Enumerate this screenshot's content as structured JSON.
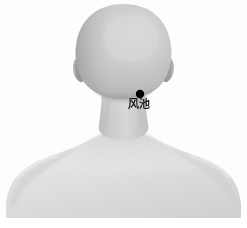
{
  "figure": {
    "background_color": "#ffffff",
    "width": 247,
    "height": 228
  },
  "body": {
    "skin_tone_head": "#c6c6c6",
    "skin_tone_head_shadow": "#ababab",
    "skin_tone_head_highlight": "#d8d8d8",
    "skin_tone_neck": "#cfcfcf",
    "skin_tone_torso": "#e2e2e2",
    "skin_tone_torso_shadow": "#cdcdcd",
    "outline_color": "#bdbdbd",
    "parts": [
      {
        "name": "cranium",
        "label": "Head (occipital / back view)"
      },
      {
        "name": "left-ear",
        "label": "Left ear"
      },
      {
        "name": "right-ear",
        "label": "Right ear"
      },
      {
        "name": "neck",
        "label": "Neck"
      },
      {
        "name": "left-shoulder",
        "label": "Left shoulder"
      },
      {
        "name": "right-shoulder",
        "label": "Right shoulder"
      },
      {
        "name": "upper-back",
        "label": "Upper back / trapezius"
      }
    ]
  },
  "acupoints": [
    {
      "id": "GB20",
      "label": "风池",
      "pinyin": "Feng Chi",
      "marker_color": "#000000",
      "marker_radius": 4,
      "x": 140,
      "y": 94,
      "label_x": 128,
      "label_y": 100
    }
  ]
}
